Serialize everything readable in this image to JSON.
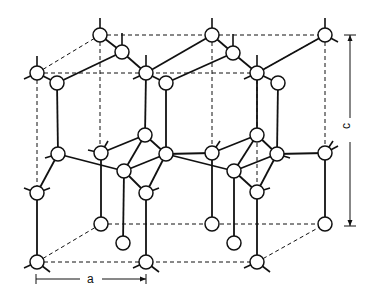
{
  "diagram": {
    "type": "crystal-structure",
    "labels": {
      "a": "a",
      "c": "c"
    },
    "colors": {
      "line": "#111111",
      "atom_fill": "#ffffff",
      "background": "#ffffff"
    },
    "dimensions": {
      "a": {
        "label": "a",
        "x1": 37,
        "x2": 146,
        "y": 279
      },
      "c": {
        "label": "c",
        "x": 350,
        "y1": 35,
        "y2": 225
      }
    },
    "atoms": [
      {
        "id": "t1",
        "x": 100,
        "y": 35
      },
      {
        "id": "t2",
        "x": 212,
        "y": 35
      },
      {
        "id": "t3",
        "x": 325,
        "y": 35
      },
      {
        "id": "t4",
        "x": 122,
        "y": 52
      },
      {
        "id": "t5",
        "x": 233,
        "y": 53
      },
      {
        "id": "t6",
        "x": 37,
        "y": 73
      },
      {
        "id": "t7",
        "x": 146,
        "y": 73
      },
      {
        "id": "t8",
        "x": 257,
        "y": 73
      },
      {
        "id": "t9",
        "x": 57,
        "y": 83
      },
      {
        "id": "t10",
        "x": 166,
        "y": 83
      },
      {
        "id": "t11",
        "x": 278,
        "y": 83
      },
      {
        "id": "m1",
        "x": 145,
        "y": 135
      },
      {
        "id": "m2",
        "x": 257,
        "y": 135
      },
      {
        "id": "m3",
        "x": 58,
        "y": 154
      },
      {
        "id": "m4",
        "x": 101,
        "y": 153
      },
      {
        "id": "m5",
        "x": 166,
        "y": 154
      },
      {
        "id": "m6",
        "x": 212,
        "y": 153
      },
      {
        "id": "m7",
        "x": 277,
        "y": 154
      },
      {
        "id": "m8",
        "x": 325,
        "y": 153
      },
      {
        "id": "m9",
        "x": 124,
        "y": 171
      },
      {
        "id": "m10",
        "x": 234,
        "y": 171
      },
      {
        "id": "m11",
        "x": 37,
        "y": 193
      },
      {
        "id": "m12",
        "x": 146,
        "y": 193
      },
      {
        "id": "m13",
        "x": 257,
        "y": 192
      },
      {
        "id": "b1",
        "x": 101,
        "y": 224
      },
      {
        "id": "b2",
        "x": 212,
        "y": 224
      },
      {
        "id": "b3",
        "x": 325,
        "y": 224
      },
      {
        "id": "b4",
        "x": 123,
        "y": 243
      },
      {
        "id": "b5",
        "x": 234,
        "y": 243
      },
      {
        "id": "b6",
        "x": 37,
        "y": 262
      },
      {
        "id": "b7",
        "x": 146,
        "y": 262
      },
      {
        "id": "b8",
        "x": 257,
        "y": 262
      }
    ]
  }
}
